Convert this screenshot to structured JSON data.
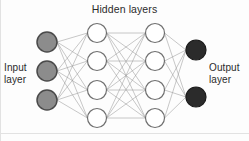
{
  "diagram": {
    "type": "neural-network",
    "title": "Hidden layers",
    "input_label": "Input\nlayer",
    "output_label": "Output\nlayer",
    "background_color": "#fdfdfd",
    "text_color": "#2b2b2b",
    "edge_color": "#9a9a9a",
    "layers": [
      {
        "id": "input",
        "name": "Input layer",
        "node_count": 3,
        "node_fill": "#8c8c8c",
        "node_stroke": "#4a4a4a",
        "radius": 10,
        "x": 47,
        "node_y": [
          42,
          71,
          100
        ]
      },
      {
        "id": "hidden1",
        "name": "Hidden layer 1",
        "node_count": 4,
        "node_fill": "#ffffff",
        "node_stroke": "#6f6f6f",
        "radius": 9.5,
        "x": 97,
        "node_y": [
          33,
          61,
          90,
          118
        ]
      },
      {
        "id": "hidden2",
        "name": "Hidden layer 2",
        "node_count": 4,
        "node_fill": "#ffffff",
        "node_stroke": "#6f6f6f",
        "radius": 9.5,
        "x": 155,
        "node_y": [
          33,
          61,
          90,
          118
        ]
      },
      {
        "id": "output",
        "name": "Output layer",
        "node_count": 2,
        "node_fill": "#2b2b2b",
        "node_stroke": "#1a1a1a",
        "radius": 10,
        "x": 196,
        "node_y": [
          50,
          97
        ]
      }
    ],
    "connections": [
      {
        "from": "input",
        "to": "hidden1",
        "fully_connected": true,
        "edge_count": 12
      },
      {
        "from": "hidden1",
        "to": "hidden2",
        "fully_connected": true,
        "edge_count": 16
      },
      {
        "from": "hidden2",
        "to": "output",
        "fully_connected": true,
        "edge_count": 8
      }
    ],
    "total_nodes": 13,
    "total_edges": 36
  }
}
